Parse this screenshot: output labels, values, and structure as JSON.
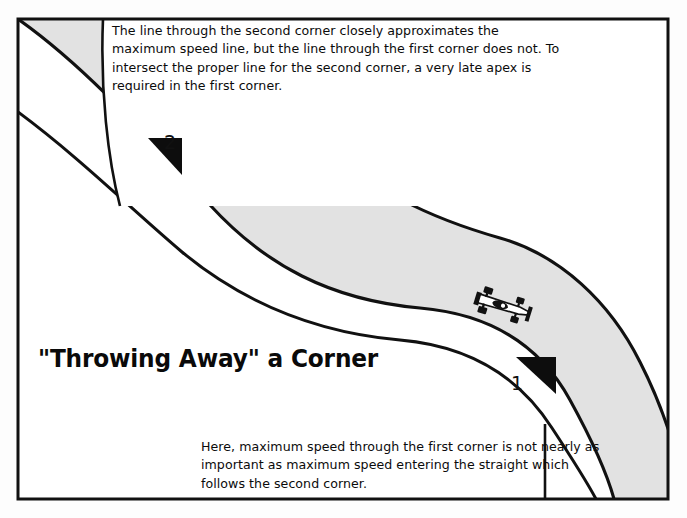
{
  "figure": {
    "title": "\"Throwing Away\" a Corner",
    "top_note": "The line through the second corner closely approximates the maximum speed line, but the line through the first corner does not.  To intersect the proper line for the second corner, a very late apex is required in the first corner.",
    "bottom_note": "Here, maximum speed through the first corner is not nearly as important as maximum speed entering the straight which follows the second corner.",
    "markers": [
      {
        "label": "1",
        "meaning": "first-corner"
      },
      {
        "label": "2",
        "meaning": "second-corner"
      }
    ],
    "vehicle": {
      "name": "race-car",
      "view": "overhead"
    },
    "colors": {
      "page_background": "#fdfdfd",
      "track_surface": "#e2e2e2",
      "track_edge": "#111111",
      "frame_border": "#111111",
      "marker_fill": "#0d0d0d",
      "text": "#0b0b0b",
      "car_body": "#ffffff",
      "car_detail": "#111111"
    }
  }
}
